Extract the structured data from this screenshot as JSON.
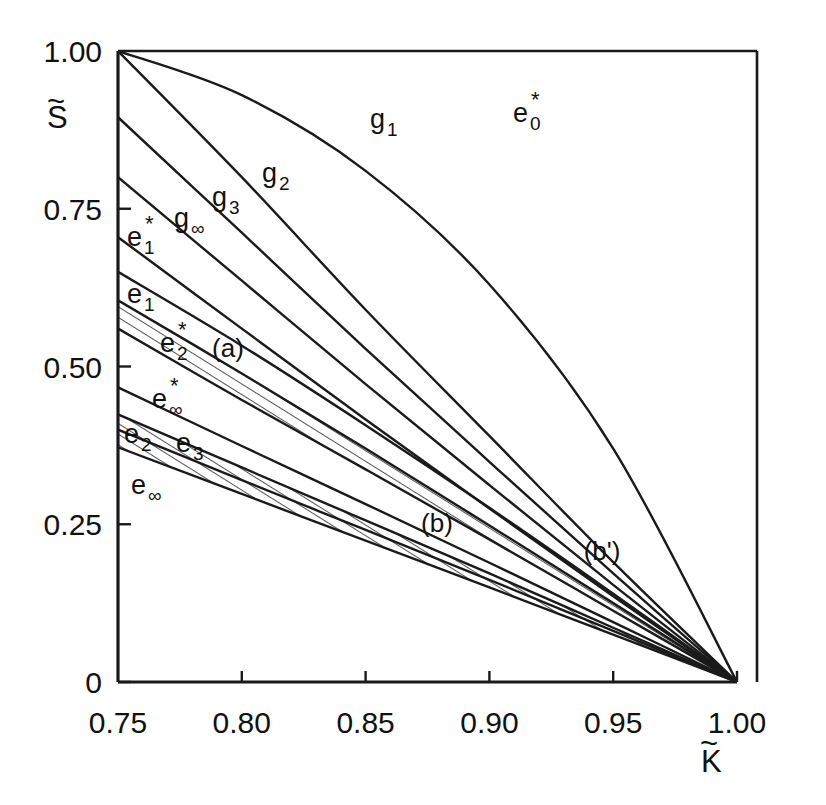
{
  "chart_data": {
    "type": "line",
    "title": "",
    "xlabel": "K̃",
    "ylabel": "S̃",
    "xlim": [
      0.75,
      1.0
    ],
    "ylim": [
      0.0,
      1.0
    ],
    "grid": false,
    "legend_position": "inline-curve-labels",
    "xticks": [
      "0.75",
      "0.80",
      "0.85",
      "0.90",
      "0.95",
      "1.00"
    ],
    "xtick_values": [
      0.75,
      0.8,
      0.85,
      0.9,
      0.95,
      1.0
    ],
    "yticks": [
      "0",
      "0.25",
      "0.50",
      "0.75",
      "1.00"
    ],
    "ytick_values": [
      0.0,
      0.25,
      0.5,
      0.75,
      1.0
    ],
    "note": "All curves terminate at the common point (1.00, 0).",
    "series": [
      {
        "name": "g1",
        "label": "g",
        "sub": "1",
        "sup": "",
        "x": [
          0.75,
          0.8,
          0.85,
          0.9,
          0.95,
          1.0
        ],
        "y": [
          1.0,
          0.8,
          0.59,
          0.39,
          0.19,
          0.0
        ]
      },
      {
        "name": "g2",
        "label": "g",
        "sub": "2",
        "sup": "",
        "x": [
          0.75,
          0.8,
          0.85,
          0.9,
          0.95,
          1.0
        ],
        "y": [
          0.895,
          0.712,
          0.528,
          0.349,
          0.172,
          0.0
        ]
      },
      {
        "name": "g3",
        "label": "g",
        "sub": "3",
        "sup": "",
        "x": [
          0.75,
          0.8,
          0.85,
          0.9,
          0.95,
          1.0
        ],
        "y": [
          0.8,
          0.636,
          0.472,
          0.312,
          0.154,
          0.0
        ]
      },
      {
        "name": "g-inf",
        "label": "g",
        "sub": "∞",
        "sup": "",
        "x": [
          0.75,
          0.8,
          0.85,
          0.9,
          0.95,
          1.0
        ],
        "y": [
          0.705,
          0.56,
          0.416,
          0.275,
          0.136,
          0.0
        ]
      },
      {
        "name": "e0star",
        "label": "e",
        "sub": "0",
        "sup": "*",
        "x": [
          0.75,
          0.8,
          0.85,
          0.9,
          0.95,
          1.0
        ],
        "y": [
          1.0,
          0.93,
          0.81,
          0.63,
          0.37,
          0.0
        ]
      },
      {
        "name": "e1star",
        "label": "e",
        "sub": "1",
        "sup": "*",
        "x": [
          0.75,
          0.8,
          0.85,
          0.9,
          0.95,
          1.0
        ],
        "y": [
          0.65,
          0.533,
          0.407,
          0.276,
          0.14,
          0.0
        ]
      },
      {
        "name": "e1",
        "label": "e",
        "sub": "1",
        "sup": "",
        "x": [
          0.75,
          0.8,
          0.85,
          0.9,
          0.95,
          1.0
        ],
        "y": [
          0.605,
          0.489,
          0.37,
          0.248,
          0.125,
          0.0
        ]
      },
      {
        "name": "e2star",
        "label": "e",
        "sub": "2",
        "sup": "*",
        "x": [
          0.75,
          0.8,
          0.85,
          0.9,
          0.95,
          1.0
        ],
        "y": [
          0.56,
          0.447,
          0.337,
          0.226,
          0.113,
          0.0
        ]
      },
      {
        "name": "e-inf-star",
        "label": "e",
        "sub": "∞",
        "sup": "*",
        "x": [
          0.75,
          0.8,
          0.85,
          0.9,
          0.95,
          1.0
        ],
        "y": [
          0.467,
          0.374,
          0.282,
          0.189,
          0.095,
          0.0
        ]
      },
      {
        "name": "e2",
        "label": "e",
        "sub": "2",
        "sup": "",
        "x": [
          0.75,
          0.8,
          0.85,
          0.9,
          0.95,
          1.0
        ],
        "y": [
          0.424,
          0.34,
          0.256,
          0.172,
          0.086,
          0.0
        ]
      },
      {
        "name": "e3",
        "label": "e",
        "sub": "3",
        "sup": "",
        "x": [
          0.75,
          0.8,
          0.85,
          0.9,
          0.95,
          1.0
        ],
        "y": [
          0.4,
          0.32,
          0.241,
          0.162,
          0.081,
          0.0
        ]
      },
      {
        "name": "e-inf",
        "label": "e",
        "sub": "∞",
        "sup": "",
        "x": [
          0.75,
          0.8,
          0.85,
          0.9,
          0.95,
          1.0
        ],
        "y": [
          0.372,
          0.298,
          0.224,
          0.15,
          0.075,
          0.0
        ]
      }
    ],
    "shaded_regions": [
      {
        "name": "a",
        "label": "(a)",
        "upper_series": "e1",
        "lower_series": "e2star",
        "label_x": 0.808,
        "label_y": 0.543,
        "hatch": "diagonal"
      },
      {
        "name": "b",
        "label": "(b)",
        "upper_series": "e2",
        "lower_series": "e-inf",
        "label_x": 0.878,
        "label_y": 0.277,
        "hatch": "diagonal"
      },
      {
        "name": "bp",
        "label": "(b')",
        "upper_series": "e3",
        "lower_series": "e-inf",
        "label_x": 0.932,
        "label_y": 0.188,
        "hatch": "none"
      }
    ]
  },
  "axes": {
    "x_axis_title": "K̃",
    "y_axis_title": "S̃",
    "line_color": "#1a1a1a",
    "background": "#ffffff"
  },
  "curve_labels": [
    {
      "name": "g1",
      "text_base": "g",
      "sub": "1",
      "sup": "",
      "x": 370,
      "y": 128
    },
    {
      "name": "e0star",
      "text_base": "e",
      "sub": "0",
      "sup": "*",
      "x": 513,
      "y": 122
    },
    {
      "name": "g2",
      "text_base": "g",
      "sub": "2",
      "sup": "",
      "x": 262,
      "y": 182
    },
    {
      "name": "g3",
      "text_base": "g",
      "sub": "3",
      "sup": "",
      "x": 212,
      "y": 206
    },
    {
      "name": "g-inf",
      "text_base": "g",
      "sub": "∞",
      "sup": "",
      "x": 174,
      "y": 227
    },
    {
      "name": "e1star",
      "text_base": "e",
      "sub": "1",
      "sup": "*",
      "x": 127,
      "y": 246
    },
    {
      "name": "e1",
      "text_base": "e",
      "sub": "1",
      "sup": "",
      "x": 127,
      "y": 303
    },
    {
      "name": "e2star",
      "text_base": "e",
      "sub": "2",
      "sup": "*",
      "x": 160,
      "y": 352
    },
    {
      "name": "e-inf-star",
      "text_base": "e",
      "sub": "∞",
      "sup": "*",
      "x": 152,
      "y": 408
    },
    {
      "name": "e2",
      "text_base": "e",
      "sub": "2",
      "sup": "",
      "x": 124,
      "y": 443
    },
    {
      "name": "e3",
      "text_base": "e",
      "sub": "3",
      "sup": "",
      "x": 176,
      "y": 452
    },
    {
      "name": "e-inf",
      "text_base": "e",
      "sub": "∞",
      "sup": "",
      "x": 131,
      "y": 494
    }
  ],
  "region_labels": [
    {
      "name": "a",
      "text": "(a)",
      "x": 228,
      "y": 357
    },
    {
      "name": "b",
      "text": "(b)",
      "x": 437,
      "y": 532
    },
    {
      "name": "bp",
      "text": "(b')",
      "x": 602,
      "y": 560
    }
  ]
}
